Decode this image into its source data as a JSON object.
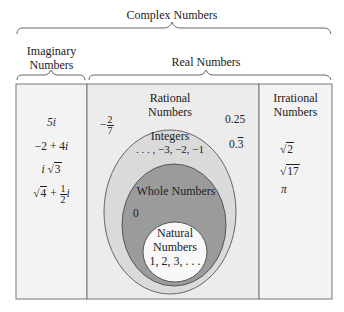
{
  "title": "Complex Numbers",
  "groups": {
    "imaginary": {
      "label_line1": "Imaginary",
      "label_line2": "Numbers"
    },
    "real": {
      "label": "Real Numbers"
    },
    "rational": {
      "label_line1": "Rational",
      "label_line2": "Numbers"
    },
    "irrational": {
      "label_line1": "Irrational",
      "label_line2": "Numbers"
    },
    "integers": {
      "label": "Integers",
      "examples": ". . . , −3, −2, −1"
    },
    "whole": {
      "label": "Whole Numbers",
      "examples": "0"
    },
    "natural": {
      "label_line1": "Natural",
      "label_line2": "Numbers",
      "examples": "1, 2, 3, . . ."
    }
  },
  "imaginary_examples": {
    "e1": "5i",
    "e2_a": "−2 + 4",
    "e2_b": "i",
    "e3_a": "i",
    "e3_rad": "3",
    "e4_rad": "4",
    "e4_plus": " + ",
    "e4_num": "1",
    "e4_den": "2",
    "e4_i": "i"
  },
  "rational_examples": {
    "neg_frac_sign": "−",
    "neg_frac_num": "2",
    "neg_frac_den": "7",
    "decimal": "0.25",
    "repeating_int": "0.",
    "repeating_digit": "3"
  },
  "irrational_examples": {
    "e1_rad": "2",
    "e2_rad": "17",
    "e3": "π"
  },
  "colors": {
    "outer_panel": "#f3f3f3",
    "rational_panel": "#ececec",
    "integers_fill": "#dadada",
    "whole_fill": "#9b9b9b",
    "natural_fill": "#f8f8f8",
    "border": "#777777"
  }
}
